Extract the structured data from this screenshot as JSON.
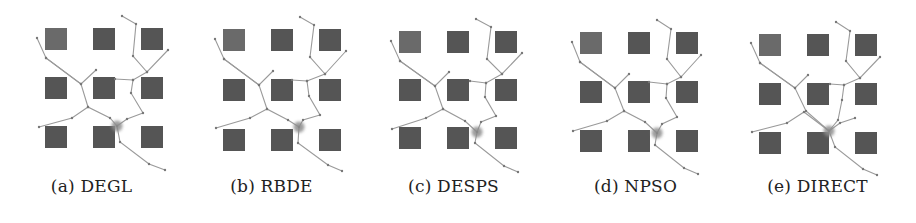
{
  "figure": {
    "panels": [
      {
        "id": "a",
        "label": "(a) DEGL"
      },
      {
        "id": "b",
        "label": "(b) RBDE"
      },
      {
        "id": "c",
        "label": "(c) DESPS"
      },
      {
        "id": "d",
        "label": "(d) NPSO"
      },
      {
        "id": "e",
        "label": "(e) DIRECT"
      }
    ],
    "obstacle_grid": {
      "rows": 3,
      "cols": 3
    },
    "colors": {
      "obstacle": "#555555",
      "path": "#9a9a9a",
      "node": "#777777",
      "target_blob": "#8c8c8c"
    }
  }
}
